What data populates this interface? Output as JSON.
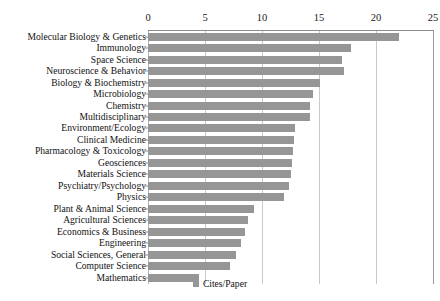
{
  "chart_data": {
    "type": "bar",
    "orientation": "horizontal",
    "title": "",
    "xlabel": "",
    "ylabel": "",
    "xlim": [
      0,
      25
    ],
    "xticks": [
      0,
      5,
      10,
      15,
      20,
      25
    ],
    "grid": true,
    "axis_position": "top",
    "legend": {
      "position": "bottom",
      "entries": [
        {
          "label": "Cites/Paper",
          "color": "#969696"
        }
      ]
    },
    "series_name": "Cites/Paper",
    "bar_color": "#969696",
    "categories": [
      "Molecular Biology & Genetics",
      "Immunology",
      "Space Science",
      "Neuroscience & Behavior",
      "Biology & Biochemistry",
      "Microbiology",
      "Chemistry",
      "Multidisciplinary",
      "Environment/Ecology",
      "Clinical Medicine",
      "Pharmacology & Toxicology",
      "Geosciences",
      "Materials Science",
      "Psychiatry/Psychology",
      "Physics",
      "Plant & Animal Science",
      "Agricultural Sciences",
      "Economics & Business",
      "Engineering",
      "Social Sciences, General",
      "Computer Science",
      "Mathematics"
    ],
    "values": [
      22.0,
      17.8,
      17.0,
      17.2,
      15.1,
      14.5,
      14.2,
      14.2,
      12.9,
      12.8,
      12.7,
      12.6,
      12.5,
      12.4,
      11.9,
      9.3,
      8.8,
      8.5,
      8.2,
      7.7,
      7.2,
      4.5
    ]
  },
  "legend": {
    "label": "Cites/Paper"
  }
}
